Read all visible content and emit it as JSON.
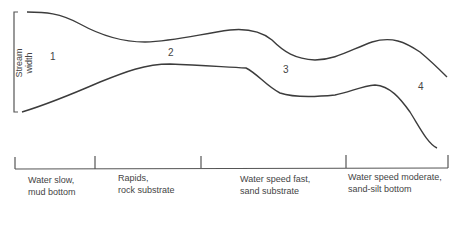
{
  "diagram": {
    "axis_label": {
      "line1": "Stream",
      "line2": "width"
    },
    "zones": [
      {
        "number": "1",
        "x": 50,
        "y": 52
      },
      {
        "number": "2",
        "x": 168,
        "y": 48
      },
      {
        "number": "3",
        "x": 283,
        "y": 65
      },
      {
        "number": "4",
        "x": 418,
        "y": 82
      }
    ],
    "segments": [
      {
        "line1": "Water slow,",
        "line2": "mud bottom",
        "x": 28,
        "y": 172
      },
      {
        "line1": "Rapids,",
        "line2": "rock substrate",
        "x": 118,
        "y": 172
      },
      {
        "line1": "Water speed fast,",
        "line2": "sand substrate",
        "x": 240,
        "y": 172
      },
      {
        "line1": "Water speed moderate,",
        "line2": "sand-silt bottom",
        "x": 348,
        "y": 170
      }
    ],
    "colors": {
      "line": "#3c3c3c",
      "text": "#444444",
      "background": "#ffffff"
    }
  }
}
